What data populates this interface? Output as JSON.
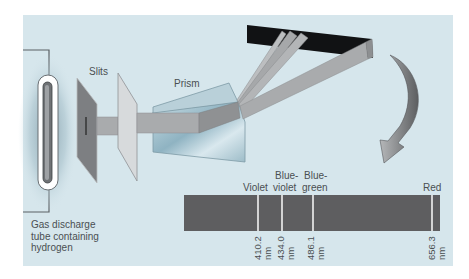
{
  "colors": {
    "panel_bg": "#d6e6ec",
    "spectrum_bar": "#5e5e60",
    "spectrum_line": "#f2f2f2",
    "screen": "#111214",
    "beam": "#a9abad",
    "text": "#4a4f52"
  },
  "labels": {
    "tube": [
      "Gas discharge",
      "tube containing",
      "hydrogen"
    ],
    "slits": "Slits",
    "prism": "Prism"
  },
  "spectrum": {
    "lines": [
      {
        "color_name_lines": [
          "",
          "Violet"
        ],
        "wavelength": "410.2",
        "unit": "nm"
      },
      {
        "color_name_lines": [
          "Blue-",
          "violet"
        ],
        "wavelength": "434.0",
        "unit": "nm"
      },
      {
        "color_name_lines": [
          "Blue-",
          "green"
        ],
        "wavelength": "486.1",
        "unit": "nm"
      },
      {
        "color_name_lines": [
          "",
          "Red"
        ],
        "wavelength": "656.3",
        "unit": "nm"
      }
    ]
  }
}
